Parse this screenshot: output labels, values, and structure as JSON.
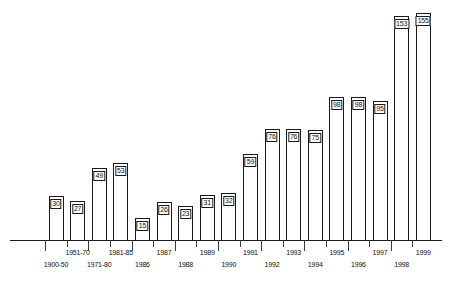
{
  "chart_data": {
    "type": "bar",
    "title": "",
    "subtitle": "",
    "xlabel": "",
    "ylabel": "",
    "grid": false,
    "legend": null,
    "ylim": [
      0,
      160
    ],
    "categories": [
      "1900-50",
      "1951-70",
      "1971-80",
      "1981-85",
      "1986",
      "1987",
      "1988",
      "1989",
      "1990",
      "1991",
      "1992",
      "1993",
      "1994",
      "1995",
      "1996",
      "1997",
      "1998",
      "1999"
    ],
    "values": [
      30,
      27,
      49,
      53,
      15,
      26,
      23,
      31,
      32,
      59,
      76,
      76,
      75,
      98,
      98,
      95,
      153,
      155
    ],
    "bars": [
      {
        "category": "1900-50",
        "value": 30,
        "label": "30",
        "label_row": "bottom"
      },
      {
        "category": "1951-70",
        "value": 27,
        "label": "27",
        "label_row": "top"
      },
      {
        "category": "1971-80",
        "value": 49,
        "label": "49",
        "label_row": "bottom"
      },
      {
        "category": "1981-85",
        "value": 53,
        "label": "53",
        "label_row": "top"
      },
      {
        "category": "1986",
        "value": 15,
        "label": "15",
        "label_row": "bottom"
      },
      {
        "category": "1987",
        "value": 26,
        "label": "26",
        "label_row": "top"
      },
      {
        "category": "1988",
        "value": 23,
        "label": "23",
        "label_row": "bottom"
      },
      {
        "category": "1989",
        "value": 31,
        "label": "31",
        "label_row": "top"
      },
      {
        "category": "1990",
        "value": 32,
        "label": "32",
        "label_row": "bottom"
      },
      {
        "category": "1991",
        "value": 59,
        "label": "59",
        "label_row": "top"
      },
      {
        "category": "1992",
        "value": 76,
        "label": "76",
        "label_row": "bottom"
      },
      {
        "category": "1993",
        "value": 76,
        "label": "76",
        "label_row": "top"
      },
      {
        "category": "1994",
        "value": 75,
        "label": "75",
        "label_row": "bottom"
      },
      {
        "category": "1995",
        "value": 98,
        "label": "98",
        "label_row": "top"
      },
      {
        "category": "1996",
        "value": 98,
        "label": "98",
        "label_row": "bottom"
      },
      {
        "category": "1997",
        "value": 95,
        "label": "95",
        "label_row": "top"
      },
      {
        "category": "1998",
        "value": 153,
        "label": "153",
        "label_row": "bottom"
      },
      {
        "category": "1999",
        "value": 155,
        "label": "155",
        "label_row": "top"
      }
    ],
    "colors": {
      "bar_fill": "#ffffff",
      "bar_stroke": "#1a1a1a",
      "axis": "#1a1a1a",
      "text": "#111111",
      "background": "#ffffff"
    }
  }
}
